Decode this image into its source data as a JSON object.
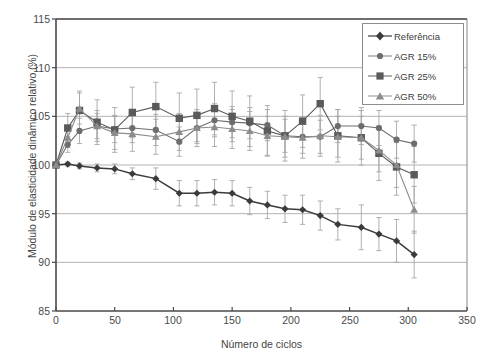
{
  "chart_data": {
    "type": "line",
    "title": "",
    "xlabel": "Número de ciclos",
    "ylabel": "Módulo de elasticidade dinâmico relativo (%)",
    "xlim": [
      0,
      350
    ],
    "ylim": [
      85,
      115
    ],
    "xticks": [
      0,
      50,
      100,
      150,
      200,
      250,
      300,
      350
    ],
    "yticks": [
      85,
      90,
      95,
      100,
      105,
      110,
      115
    ],
    "grid": "horizontal",
    "legend_position": "top-right",
    "errorbars": true,
    "series": [
      {
        "name": "Referência",
        "marker": "diamond",
        "color": "#3b3b3b",
        "x": [
          0,
          10,
          20,
          35,
          50,
          65,
          85,
          105,
          120,
          135,
          150,
          165,
          180,
          195,
          210,
          225,
          240,
          260,
          275,
          290,
          305
        ],
        "values": [
          100.0,
          100.1,
          99.9,
          99.7,
          99.6,
          99.1,
          98.6,
          97.1,
          97.1,
          97.2,
          97.1,
          96.3,
          95.9,
          95.5,
          95.4,
          94.8,
          93.9,
          93.6,
          92.9,
          92.2,
          90.8
        ],
        "err": [
          0.0,
          0.2,
          0.3,
          0.4,
          0.5,
          0.6,
          1.1,
          1.3,
          1.3,
          1.3,
          1.3,
          1.4,
          1.4,
          1.4,
          1.5,
          1.5,
          1.6,
          2.3,
          1.7,
          2.2,
          2.4
        ]
      },
      {
        "name": "AGR 15%",
        "marker": "circle",
        "color": "#6d6d6d",
        "x": [
          0,
          10,
          20,
          35,
          50,
          65,
          85,
          105,
          120,
          135,
          150,
          165,
          180,
          195,
          210,
          225,
          240,
          260,
          275,
          290,
          305
        ],
        "values": [
          100.0,
          102.1,
          103.5,
          104.0,
          103.7,
          103.8,
          103.6,
          102.4,
          103.8,
          104.6,
          104.4,
          104.3,
          104.1,
          103.0,
          102.9,
          102.9,
          104.0,
          104.0,
          103.8,
          102.6,
          102.2
        ],
        "err": [
          0.0,
          0.8,
          1.3,
          1.3,
          1.4,
          1.5,
          1.6,
          1.5,
          1.6,
          1.7,
          1.6,
          1.6,
          1.6,
          1.7,
          1.7,
          1.7,
          1.7,
          1.9,
          1.8,
          1.9,
          1.9
        ]
      },
      {
        "name": "AGR 25%",
        "marker": "square",
        "color": "#5a5a5a",
        "x": [
          0,
          10,
          20,
          35,
          50,
          65,
          85,
          105,
          120,
          135,
          150,
          165,
          180,
          195,
          210,
          225,
          240,
          260,
          275,
          290,
          305
        ],
        "values": [
          100.0,
          103.8,
          105.6,
          104.4,
          103.6,
          105.4,
          106.0,
          104.8,
          105.1,
          105.8,
          105.0,
          104.5,
          103.5,
          103.0,
          104.5,
          106.3,
          103.0,
          102.8,
          101.2,
          99.8,
          99.0
        ],
        "err": [
          0.0,
          1.5,
          2.0,
          2.3,
          2.3,
          2.6,
          2.5,
          2.6,
          2.7,
          2.7,
          2.6,
          2.6,
          2.6,
          2.6,
          2.7,
          2.7,
          2.7,
          2.8,
          2.8,
          2.9,
          2.9
        ]
      },
      {
        "name": "AGR 50%",
        "marker": "triangle",
        "color": "#8c8c8c",
        "x": [
          0,
          10,
          20,
          35,
          50,
          65,
          85,
          105,
          120,
          135,
          150,
          165,
          180,
          195,
          210,
          225,
          240,
          260,
          275,
          290,
          305
        ],
        "values": [
          100.0,
          102.8,
          105.8,
          104.0,
          103.3,
          103.2,
          102.9,
          103.4,
          103.8,
          103.9,
          103.7,
          103.5,
          103.0,
          102.9,
          102.8,
          103.0,
          102.9,
          102.8,
          101.5,
          100.0,
          95.4
        ],
        "err": [
          0.0,
          1.0,
          1.6,
          1.6,
          1.7,
          1.8,
          1.8,
          1.9,
          1.9,
          2.0,
          2.0,
          2.0,
          2.0,
          2.1,
          2.1,
          2.1,
          2.1,
          2.2,
          2.2,
          2.3,
          2.4
        ]
      }
    ]
  },
  "axes": {
    "ylabel": "Módulo de elasticidade dinâmico relativo (%)",
    "xlabel": "Número de ciclos",
    "yticks": [
      "115",
      "110",
      "105",
      "100",
      "95",
      "90",
      "85"
    ],
    "xticks": [
      "0",
      "50",
      "100",
      "150",
      "200",
      "250",
      "300",
      "350"
    ]
  },
  "legend": {
    "items": [
      {
        "label": "Referência",
        "marker": "diamond",
        "color": "#3b3b3b"
      },
      {
        "label": "AGR 15%",
        "marker": "circle",
        "color": "#6d6d6d"
      },
      {
        "label": "AGR 25%",
        "marker": "square",
        "color": "#5a5a5a"
      },
      {
        "label": "AGR 50%",
        "marker": "triangle",
        "color": "#8c8c8c"
      }
    ]
  }
}
